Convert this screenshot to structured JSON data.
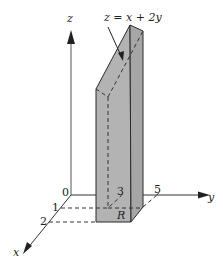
{
  "diagram": {
    "surface_label": "z = x + 2y",
    "region_label": "R",
    "axes": {
      "x": {
        "label": "x",
        "ticks": [
          "1",
          "2"
        ]
      },
      "y": {
        "label": "y",
        "ticks": [
          "3",
          "5"
        ]
      },
      "z": {
        "label": "z"
      },
      "origin_label": "0"
    },
    "colors": {
      "solid_fill": "#b3b3b3",
      "solid_side": "#a6a6a6",
      "top_fill": "#bdbdbd",
      "line": "#2a2a2a"
    }
  }
}
